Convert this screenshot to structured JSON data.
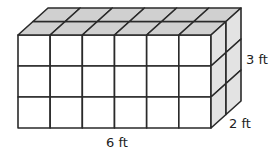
{
  "figure": {
    "type": "rectangular prism of unit cubes",
    "units_length": 6,
    "units_width": 2,
    "units_height": 3,
    "labels": {
      "height": "3 ft",
      "width": "2 ft",
      "length": "6 ft"
    },
    "colors": {
      "front_face": "#ffffff",
      "top_face": "#d0d0d0",
      "side_face": "#e3e3e3",
      "edge": "#2a2a2a"
    }
  }
}
